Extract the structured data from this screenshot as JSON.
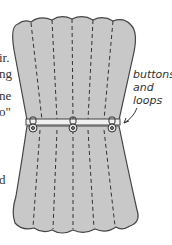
{
  "figure": {
    "callout": {
      "lines": [
        "buttons",
        "and",
        "loops"
      ]
    },
    "left_text_fragments": [
      "ir.",
      "ng",
      "ne",
      "o\"",
      "d"
    ],
    "colors": {
      "fabric": "#c8c8c8",
      "outline": "#444444",
      "stitch": "#333333",
      "band": "#f0f0f0",
      "text": "#333333"
    },
    "buttons": [
      {
        "x": 33,
        "y": 128
      },
      {
        "x": 73,
        "y": 128
      },
      {
        "x": 112,
        "y": 128
      }
    ]
  }
}
